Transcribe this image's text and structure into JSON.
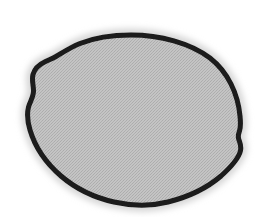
{
  "image": {
    "kind": "scanned-specimen-silhouette",
    "subject_label": "lemon outline",
    "width": 271,
    "height": 217,
    "background_color": "#ffffff",
    "caption": ""
  },
  "shape": {
    "name": "lemon-silhouette",
    "outline_color": "#1a1a1a",
    "fill_color": "#bdbdbd",
    "halo_color": "#d6d6d6",
    "stroke_width": 5,
    "texture": "halftone-dither",
    "bounding_box": {
      "x": 26,
      "y": 33,
      "width": 218,
      "height": 175
    },
    "extremes": {
      "leftmost": {
        "x": 28,
        "y": 110
      },
      "rightmost": {
        "x": 241,
        "y": 136
      },
      "topmost": {
        "x": 131,
        "y": 35
      },
      "bottommost": {
        "x": 148,
        "y": 204
      }
    },
    "features": [
      {
        "name": "upper-left-shoulder-notch",
        "x": 47,
        "y": 61
      },
      {
        "name": "right-tip-inflection",
        "x": 239,
        "y": 132
      }
    ],
    "path": "M 131 35 C 160 35 190 43 210 58 C 228 72 238 94 240 116 C 240.8 124 240.5 128 239.5 131 C 238.4 134.2 237.6 136 238.8 139.5 C 240 143 241.6 146 240.4 151 C 238.6 158.5 231 167 221 176 C 207 188 188 197 168 202 C 150 206.5 132 206 114 202 C 94 197.5 75 188 61 176 C 46 163 35 147 30 130 C 27 120 27 113 28.5 107 C 30 101.5 33.5 97 33.5 91 C 33.5 85 31.5 80 33 74.5 C 34.5 69 39 64.5 45.5 61.5 C 49.5 59.6 52.5 58.6 56 56.5 C 62 53 70 47.5 80 43.5 C 95 37.5 113 35 131 35 Z"
  }
}
